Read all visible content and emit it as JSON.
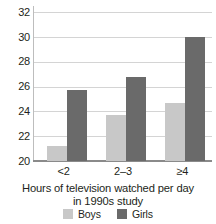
{
  "chart_data": {
    "type": "bar",
    "title": "",
    "subtitle": "",
    "xlabel": "Hours of television watched per day in 1990s study",
    "xlabel_lines": [
      "Hours of television watched per day",
      "in 1990s study"
    ],
    "ylabel": "",
    "categories": [
      "<2",
      "2–3",
      "≥4"
    ],
    "series": [
      {
        "name": "Boys",
        "color": "#c8c8c8",
        "values": [
          21.2,
          23.7,
          24.7
        ]
      },
      {
        "name": "Girls",
        "color": "#6a6a6a",
        "values": [
          25.7,
          26.8,
          30.0
        ]
      }
    ],
    "ylim": [
      20,
      32.5
    ],
    "yticks": [
      20,
      22,
      24,
      26,
      28,
      30,
      32
    ],
    "ytick_labels": [
      "20",
      "22",
      "24",
      "26",
      "28",
      "30",
      "32"
    ],
    "grid": "horizontal",
    "legend_position": "bottom",
    "legend": [
      "Boys",
      "Girls"
    ]
  },
  "colors": {
    "boys": "#c8c8c8",
    "girls": "#6a6a6a",
    "gridline": "#d4d4d4",
    "axis": "#8a8a8a",
    "text": "#231f20",
    "background": "#ffffff"
  }
}
